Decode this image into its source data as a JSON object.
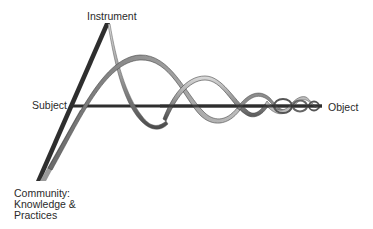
{
  "diagram": {
    "type": "activity-theory-helix",
    "nodes": {
      "instrument": "Instrument",
      "subject": "Subject",
      "object": "Object",
      "community": [
        "Community:",
        "Knowledge &",
        "Practices"
      ]
    },
    "colors": {
      "axis": "#2e2e2e",
      "ribbon_light": "#c8c8c8",
      "ribbon_dark": "#555555",
      "text": "#2a2a2a"
    }
  }
}
